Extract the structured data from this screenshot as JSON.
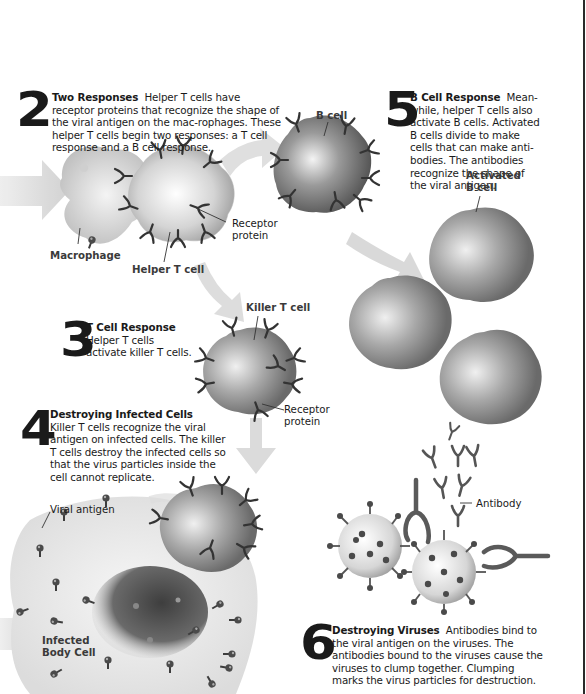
{
  "diagram": {
    "steps": [
      {
        "number": "2",
        "title": "Two Responses",
        "text": "Helper T cells have receptor proteins that recognize the shape of the viral antigen on the mac-rophages. These helper T cells begin two responses: a T cell response and a B cell response."
      },
      {
        "number": "3",
        "title": "T Cell Response",
        "text": "Helper T cells activate killer T cells."
      },
      {
        "number": "4",
        "title": "Destroying Infected Cells",
        "text": "Killer T cells recognize the viral antigen on infected cells. The killer T cells destroy the infected cells so that the virus particles inside the cell cannot replicate."
      },
      {
        "number": "5",
        "title": "B Cell Response",
        "text": "Mean-while, helper T cells also activate B cells. Activated B cells divide to make cells that can make anti-bodies. The antibodies recognize the shape of the viral antigen."
      },
      {
        "number": "6",
        "title": "Destroying Viruses",
        "text": "Antibodies bind to the viral antigen on the viruses. The antibodies bound to the viruses cause the viruses to clump together. Clumping marks the virus particles for destruction."
      }
    ],
    "labels": {
      "macrophage": "Macrophage",
      "helper_t_cell": "Helper T cell",
      "receptor_protein_1": "Receptor protein",
      "b_cell": "B cell",
      "activated_b_cell": "Activated B cell",
      "killer_t_cell": "Killer T cell",
      "receptor_protein_2": "Receptor protein",
      "viral_antigen": "Viral antigen",
      "infected_body_cell": "Infected Body Cell",
      "antibody": "Antibody"
    },
    "colors": {
      "text": "#1a1a1a",
      "label": "#3a3a3a",
      "arrow": "#d8d8d8",
      "cell_dark": "#6e6e6e",
      "cell_light": "#f2f2f2",
      "receptor": "#333333"
    }
  }
}
